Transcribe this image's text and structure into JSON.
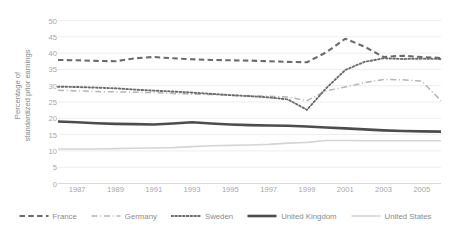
{
  "chart_data": {
    "type": "line",
    "title": "",
    "subtitle": "",
    "xlabel": "",
    "ylabel": "Percentage of standardized prior earnings",
    "ylabel_line1": "Percentage of",
    "ylabel_line2": "standardized prior earnings",
    "ylim": [
      0,
      50
    ],
    "ytick_step": 5,
    "yticks": [
      50,
      45,
      40,
      35,
      30,
      25,
      20,
      15,
      10,
      5,
      0
    ],
    "xlim": [
      1986,
      2006
    ],
    "xticks": [
      "1987",
      "1989",
      "1991",
      "1993",
      "1995",
      "1997",
      "1999",
      "2001",
      "2003",
      "2005"
    ],
    "x": [
      1986,
      1987,
      1988,
      1989,
      1990,
      1991,
      1992,
      1993,
      1994,
      1995,
      1996,
      1997,
      1998,
      1999,
      2000,
      2001,
      2002,
      2003,
      2004,
      2005,
      2006
    ],
    "grid": "horizontal",
    "legend_position": "bottom",
    "series": [
      {
        "name": "France",
        "dash": "dashed",
        "color": "#6b6b6b",
        "width": 2.1,
        "values": [
          37.9,
          37.8,
          37.6,
          37.5,
          38.4,
          38.8,
          38.4,
          38.1,
          37.9,
          37.8,
          37.7,
          37.5,
          37.3,
          37.2,
          40.2,
          44.4,
          42.0,
          38.8,
          39.2,
          38.8,
          38.5
        ]
      },
      {
        "name": "Germany",
        "dash": "dashdot",
        "color": "#b5b5b5",
        "width": 1.5,
        "values": [
          28.6,
          28.4,
          28.2,
          28.1,
          28.0,
          27.9,
          27.6,
          27.4,
          27.3,
          27.1,
          26.9,
          26.8,
          26.5,
          25.4,
          28.4,
          29.6,
          30.9,
          31.9,
          31.8,
          31.4,
          25.4
        ]
      },
      {
        "name": "Sweden",
        "dash": "dotted",
        "color": "#6b6b6b",
        "width": 1.9,
        "values": [
          29.7,
          29.6,
          29.4,
          29.2,
          28.8,
          28.5,
          28.2,
          27.9,
          27.5,
          27.1,
          26.8,
          26.4,
          25.8,
          22.6,
          29.2,
          34.8,
          37.3,
          38.4,
          38.2,
          38.3,
          38.2
        ]
      },
      {
        "name": "United Kingdom",
        "dash": "solid",
        "color": "#4d4d4d",
        "width": 2.6,
        "values": [
          19.0,
          18.8,
          18.5,
          18.3,
          18.2,
          18.1,
          18.4,
          18.8,
          18.4,
          18.1,
          17.9,
          17.8,
          17.7,
          17.5,
          17.2,
          16.9,
          16.6,
          16.3,
          16.1,
          16.0,
          15.9
        ]
      },
      {
        "name": "United States",
        "dash": "solid",
        "color": "#d5d5d5",
        "width": 1.6,
        "values": [
          10.6,
          10.6,
          10.6,
          10.7,
          10.8,
          10.9,
          11.0,
          11.3,
          11.6,
          11.7,
          11.8,
          12.0,
          12.4,
          12.6,
          13.2,
          13.2,
          13.1,
          13.1,
          13.1,
          13.1,
          13.1
        ]
      }
    ]
  },
  "legend": {
    "items": [
      {
        "label": "France"
      },
      {
        "label": "Germany"
      },
      {
        "label": "Sweden"
      },
      {
        "label": "United Kingdom"
      },
      {
        "label": "United States"
      }
    ]
  }
}
